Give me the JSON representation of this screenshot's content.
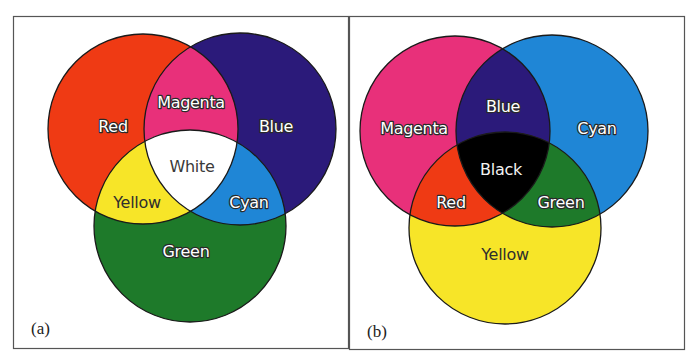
{
  "panels": [
    {
      "id": "a",
      "label": "(a)",
      "model": "additive",
      "circles": [
        {
          "name": "Red",
          "color": "#ef3a14"
        },
        {
          "name": "Blue",
          "color": "#2b1a7a"
        },
        {
          "name": "Green",
          "color": "#1e7a2a"
        }
      ],
      "regions": {
        "red": {
          "label": "Red",
          "color": "#ef3a14"
        },
        "blue": {
          "label": "Blue",
          "color": "#2b1a7a"
        },
        "green": {
          "label": "Green",
          "color": "#1e7a2a"
        },
        "magenta": {
          "label": "Magenta",
          "color": "#e8307a"
        },
        "yellow": {
          "label": "Yellow",
          "color": "#f7e528"
        },
        "cyan": {
          "label": "Cyan",
          "color": "#1f86d6"
        },
        "center": {
          "label": "White",
          "color": "#ffffff"
        }
      }
    },
    {
      "id": "b",
      "label": "(b)",
      "model": "subtractive",
      "circles": [
        {
          "name": "Magenta",
          "color": "#e8307a"
        },
        {
          "name": "Cyan",
          "color": "#1f86d6"
        },
        {
          "name": "Yellow",
          "color": "#f7e528"
        }
      ],
      "regions": {
        "magenta": {
          "label": "Magenta",
          "color": "#e8307a"
        },
        "cyan": {
          "label": "Cyan",
          "color": "#1f86d6"
        },
        "yellow": {
          "label": "Yellow",
          "color": "#f7e528"
        },
        "blue": {
          "label": "Blue",
          "color": "#2b1a7a"
        },
        "red": {
          "label": "Red",
          "color": "#ef3a14"
        },
        "green": {
          "label": "Green",
          "color": "#1e7a2a"
        },
        "center": {
          "label": "Black",
          "color": "#000000"
        }
      }
    }
  ]
}
